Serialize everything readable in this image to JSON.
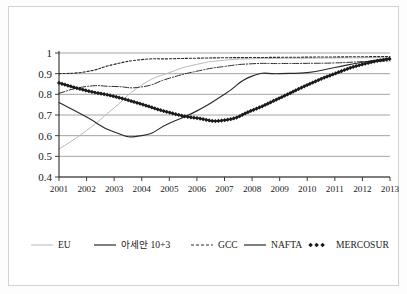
{
  "chart_data": {
    "type": "line",
    "title": "",
    "subtitle": "",
    "xlabel": "",
    "ylabel": "",
    "categories": [
      "2001",
      "2002",
      "2003",
      "2004",
      "2005",
      "2006",
      "2007",
      "2008",
      "2009",
      "2010",
      "2011",
      "2012",
      "2013"
    ],
    "x": [
      2001,
      2002,
      2003,
      2004,
      2005,
      2006,
      2007,
      2008,
      2009,
      2010,
      2011,
      2012,
      2013
    ],
    "ylim": [
      0.4,
      1.0
    ],
    "yticks": [
      "0.4",
      "0.5",
      "0.6",
      "0.7",
      "0.8",
      "0.9",
      "1"
    ],
    "ytick_values": [
      0.4,
      0.5,
      0.6,
      0.7,
      0.8,
      0.9,
      1.0
    ],
    "grid": true,
    "legend_position": "bottom",
    "series": [
      {
        "name": "EU",
        "style": "solid",
        "color": "#b9b9b9",
        "width": 1.0,
        "marker": "none",
        "values": [
          0.535,
          0.625,
          0.735,
          0.845,
          0.905,
          0.945,
          0.965,
          0.972,
          0.974,
          0.975,
          0.976,
          0.977,
          0.978
        ]
      },
      {
        "name": "아세안 10+3",
        "style": "dashdot",
        "color": "#2b2b2b",
        "width": 1.0,
        "marker": "none",
        "values": [
          0.805,
          0.838,
          0.838,
          0.836,
          0.878,
          0.912,
          0.935,
          0.948,
          0.949,
          0.95,
          0.952,
          0.958,
          0.962
        ]
      },
      {
        "name": "GCC",
        "style": "dotted",
        "color": "#2b2b2b",
        "width": 1.1,
        "marker": "none",
        "values": [
          0.9,
          0.91,
          0.945,
          0.968,
          0.972,
          0.975,
          0.977,
          0.978,
          0.979,
          0.98,
          0.981,
          0.982,
          0.983
        ]
      },
      {
        "name": "NAFTA",
        "style": "solid",
        "color": "#2b2b2b",
        "width": 1.15,
        "marker": "none",
        "values": [
          0.76,
          0.69,
          0.618,
          0.6,
          0.66,
          0.72,
          0.8,
          0.888,
          0.9,
          0.905,
          0.93,
          0.955,
          0.975
        ]
      },
      {
        "name": "MERCOSUR",
        "style": "marker-line",
        "color": "#1a1a1a",
        "width": 1.3,
        "marker": "diamond",
        "values": [
          0.855,
          0.818,
          0.79,
          0.752,
          0.712,
          0.685,
          0.675,
          0.722,
          0.782,
          0.845,
          0.9,
          0.945,
          0.972
        ]
      }
    ],
    "legend": [
      {
        "label": "EU",
        "style": "solid",
        "color": "#b9b9b9",
        "marker": "none"
      },
      {
        "label": "아세안 10+3",
        "style": "solid",
        "color": "#2b2b2b",
        "marker": "none"
      },
      {
        "label": "GCC",
        "style": "dashed",
        "color": "#2b2b2b",
        "marker": "none"
      },
      {
        "label": "NAFTA",
        "style": "solid",
        "color": "#2b2b2b",
        "marker": "none"
      },
      {
        "label": "MERCOSUR",
        "style": "dots",
        "color": "#1a1a1a",
        "marker": "diamond"
      }
    ]
  }
}
